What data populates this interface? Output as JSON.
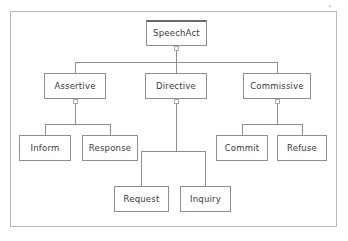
{
  "diagram": {
    "type": "tree",
    "background_color": "#ffffff",
    "frame_border_color": "#b9b9b9",
    "node_border_color": "#8e8e8e",
    "node_fill_color": "#ffffff",
    "edge_color": "#8e8e8e",
    "text_color": "#3a3a3a",
    "nodes": [
      {
        "id": "speechact",
        "label": "SpeechAct",
        "x": 146,
        "y": 20,
        "w": 61,
        "h": 26,
        "level": 0,
        "root": true
      },
      {
        "id": "assertive",
        "label": "Assertive",
        "x": 44,
        "y": 73,
        "w": 62,
        "h": 26,
        "level": 1,
        "root": false
      },
      {
        "id": "directive",
        "label": "Directive",
        "x": 145,
        "y": 73,
        "w": 62,
        "h": 26,
        "level": 1,
        "root": false
      },
      {
        "id": "commissive",
        "label": "Commissive",
        "x": 243,
        "y": 73,
        "w": 68,
        "h": 26,
        "level": 1,
        "root": false
      },
      {
        "id": "inform",
        "label": "Inform",
        "x": 19,
        "y": 135,
        "w": 52,
        "h": 26,
        "level": 2,
        "root": false
      },
      {
        "id": "response",
        "label": "Response",
        "x": 82,
        "y": 135,
        "w": 56,
        "h": 26,
        "level": 2,
        "root": false
      },
      {
        "id": "commit",
        "label": "Commit",
        "x": 216,
        "y": 135,
        "w": 52,
        "h": 26,
        "level": 2,
        "root": false
      },
      {
        "id": "refuse",
        "label": "Refuse",
        "x": 277,
        "y": 135,
        "w": 50,
        "h": 26,
        "level": 2,
        "root": false
      },
      {
        "id": "request",
        "label": "Request",
        "x": 114,
        "y": 186,
        "w": 55,
        "h": 26,
        "level": 3,
        "root": false
      },
      {
        "id": "inquiry",
        "label": "Inquiry",
        "x": 180,
        "y": 186,
        "w": 51,
        "h": 26,
        "level": 3,
        "root": false
      }
    ],
    "edges": [
      {
        "from": "speechact",
        "to": "assertive"
      },
      {
        "from": "speechact",
        "to": "directive"
      },
      {
        "from": "speechact",
        "to": "commissive"
      },
      {
        "from": "assertive",
        "to": "inform"
      },
      {
        "from": "assertive",
        "to": "response"
      },
      {
        "from": "commissive",
        "to": "commit"
      },
      {
        "from": "commissive",
        "to": "refuse"
      },
      {
        "from": "directive",
        "to": "request"
      },
      {
        "from": "directive",
        "to": "inquiry"
      }
    ]
  }
}
